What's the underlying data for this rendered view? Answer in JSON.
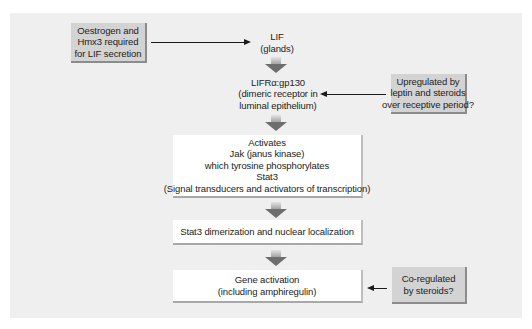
{
  "diagram": {
    "type": "flowchart",
    "background_color": "#efefef",
    "note_box_color": "#d3d3d3",
    "process_box_color": "#ffffff",
    "notes": {
      "oestrogen": {
        "lines": [
          "Oestrogen and",
          "Hmx3 required",
          "for LIF secretion"
        ]
      },
      "leptin": {
        "lines": [
          "Upregulated by",
          "leptin and steroids",
          "over receptive period?"
        ]
      },
      "steroids": {
        "lines": [
          "Co-regulated",
          "by steroids?"
        ]
      }
    },
    "steps": {
      "lif": {
        "lines": [
          "LIF",
          "(glands)"
        ]
      },
      "receptor": {
        "lines": [
          "LIFRα:gp130",
          "(dimeric receptor in",
          "luminal epithelium)"
        ]
      },
      "activates": {
        "lines": [
          "Activates",
          "Jak (janus kinase)",
          "which tyrosine phosphorylates",
          "Stat3",
          "(Signal transducers and activators of transcription)"
        ]
      },
      "dimerization": {
        "lines": [
          "Stat3 dimerization and nuclear localization"
        ]
      },
      "gene": {
        "lines": [
          "Gene activation",
          "(including amphiregulin)"
        ]
      }
    },
    "edges": [
      {
        "from": "oestrogen",
        "to": "lif",
        "style": "thin-arrow"
      },
      {
        "from": "lif",
        "to": "receptor",
        "style": "block-arrow"
      },
      {
        "from": "leptin",
        "to": "receptor",
        "style": "thin-arrow"
      },
      {
        "from": "receptor",
        "to": "activates",
        "style": "block-arrow"
      },
      {
        "from": "activates",
        "to": "dimerization",
        "style": "block-arrow"
      },
      {
        "from": "dimerization",
        "to": "gene",
        "style": "block-arrow"
      },
      {
        "from": "steroids",
        "to": "gene",
        "style": "thin-arrow"
      }
    ]
  }
}
